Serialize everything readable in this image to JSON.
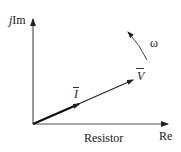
{
  "diagram": {
    "axes": {
      "imaginary_label_prefix": "j",
      "imaginary_label": "Im",
      "real_label": "Re"
    },
    "phasors": [
      {
        "name": "I",
        "label": "I",
        "description": "current phasor (bold, shorter)"
      },
      {
        "name": "V",
        "label": "V",
        "description": "voltage phasor, in phase with current"
      }
    ],
    "rotation": {
      "label": "ω",
      "direction": "counter-clockwise"
    },
    "caption": "Resistor",
    "colors": {
      "lines": "#333333",
      "text": "#222222",
      "background": "#ffffff"
    }
  }
}
